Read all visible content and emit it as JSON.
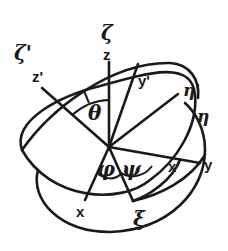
{
  "colors": {
    "ink": "#1a1a1a",
    "background": "#ffffff"
  },
  "labels": {
    "zeta": "ζ",
    "z": "z",
    "zeta_prime": "ζ'",
    "z_prime": "z'",
    "theta": "θ",
    "y_prime": "y'",
    "eta_prime": "η'",
    "eta": "η",
    "y": "y",
    "x_prime": "x'",
    "psi": "ψ",
    "phi": "φ",
    "x": "x",
    "xi": "ξ"
  },
  "angles": [
    "θ",
    "φ",
    "ψ"
  ],
  "axes": {
    "fixed": [
      "x",
      "y",
      "z"
    ],
    "rotated": [
      "x'",
      "y'",
      "z'"
    ],
    "body": [
      "ξ",
      "η",
      "ζ"
    ]
  }
}
